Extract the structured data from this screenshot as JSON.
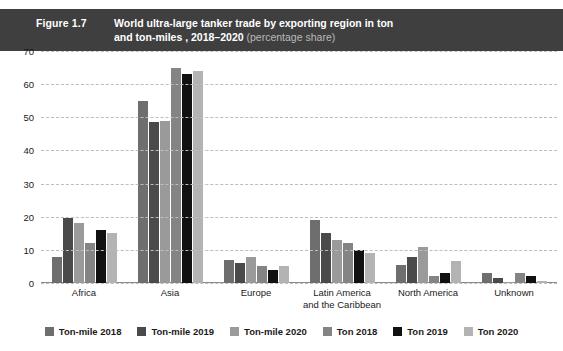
{
  "header": {
    "figure_number": "Figure 1.7",
    "title_line1": "World ultra-large tanker trade by exporting region in ton",
    "title_line2": "and ton-miles , 2018–2020",
    "title_suffix": "(percentage share)",
    "background_color": "#3f3f3f",
    "text_color": "#ffffff",
    "suffix_color": "#b9b9b9"
  },
  "chart_data": {
    "type": "bar",
    "title": "World ultra-large tanker trade by exporting region in ton and ton-miles , 2018–2020 (percentage share)",
    "xlabel": "",
    "ylabel": "",
    "ylim": [
      0,
      70
    ],
    "yticks": [
      0,
      10,
      20,
      30,
      40,
      50,
      60,
      70
    ],
    "grid": true,
    "grid_style": "dashed-horizontal",
    "legend_position": "bottom",
    "categories": [
      "Africa",
      "Asia",
      "Europe",
      "Latin America and the Caribbean",
      "North America",
      "Unknown"
    ],
    "category_labels": [
      [
        "Africa"
      ],
      [
        "Asia"
      ],
      [
        "Europe"
      ],
      [
        "Latin America",
        "and the Caribbean"
      ],
      [
        "North America"
      ],
      [
        "Unknown"
      ]
    ],
    "series": [
      {
        "name": "Ton-mile 2018",
        "color": "#6e6e6e",
        "values": [
          8,
          55,
          7,
          19,
          5.5,
          3
        ]
      },
      {
        "name": "Ton-mile 2019",
        "color": "#4a4a4a",
        "values": [
          19.5,
          48.5,
          6,
          15,
          8,
          1.5
        ]
      },
      {
        "name": "Ton-mile 2020",
        "color": "#9a9a9a",
        "values": [
          18,
          49,
          8,
          13,
          11,
          0.4
        ]
      },
      {
        "name": "Ton 2018",
        "color": "#848484",
        "values": [
          12,
          65,
          5,
          12,
          2,
          3
        ]
      },
      {
        "name": "Ton 2019",
        "color": "#111111",
        "values": [
          16,
          63,
          4,
          10,
          3,
          2
        ]
      },
      {
        "name": "Ton 2020",
        "color": "#b3b3b3",
        "values": [
          15,
          64,
          5,
          9,
          6.5,
          0.5
        ]
      }
    ]
  }
}
